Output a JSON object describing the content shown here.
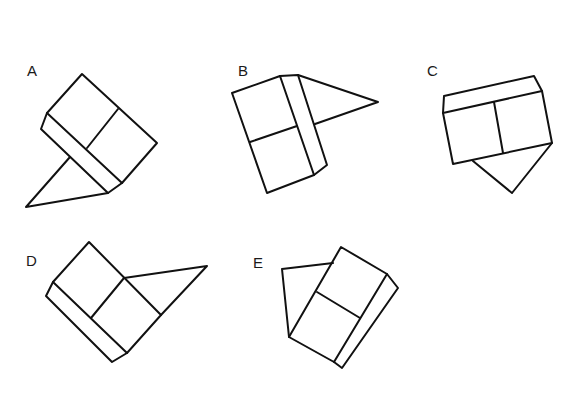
{
  "figures": [
    {
      "id": "A",
      "label": "A"
    },
    {
      "id": "B",
      "label": "B"
    },
    {
      "id": "C",
      "label": "C"
    },
    {
      "id": "D",
      "label": "D"
    },
    {
      "id": "E",
      "label": "E"
    }
  ],
  "colors": {
    "line": "#111111",
    "background": "#ffffff"
  }
}
